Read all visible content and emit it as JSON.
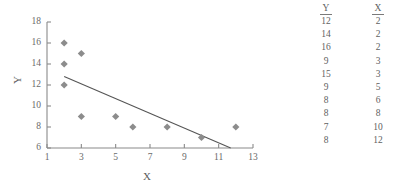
{
  "chart_data": {
    "type": "scatter",
    "title": "",
    "xlabel": "X",
    "ylabel": "Y",
    "xlim": [
      1,
      13
    ],
    "ylim": [
      6,
      18
    ],
    "xticks": [
      1,
      3,
      5,
      7,
      9,
      11,
      13
    ],
    "yticks": [
      6,
      8,
      10,
      12,
      14,
      16,
      18
    ],
    "grid": false,
    "legend": "none",
    "marker": "diamond",
    "marker_color": "#8c8c8c",
    "axis_color": "#8a8a8a",
    "line_color": "#555555",
    "points": [
      {
        "x": 2,
        "y": 12
      },
      {
        "x": 2,
        "y": 14
      },
      {
        "x": 2,
        "y": 16
      },
      {
        "x": 3,
        "y": 9
      },
      {
        "x": 3,
        "y": 15
      },
      {
        "x": 5,
        "y": 9
      },
      {
        "x": 6,
        "y": 8
      },
      {
        "x": 8,
        "y": 8
      },
      {
        "x": 10,
        "y": 7
      },
      {
        "x": 12,
        "y": 8
      }
    ],
    "trendline": {
      "x0": 2,
      "y0": 12.8,
      "x1": 11.7,
      "y1": 6.0
    }
  },
  "axes": {
    "x_title": "X",
    "y_title": "Y",
    "x_tick_labels": [
      "1",
      "3",
      "5",
      "7",
      "9",
      "11",
      "13"
    ],
    "y_tick_labels": [
      "6",
      "8",
      "10",
      "12",
      "14",
      "16",
      "18"
    ]
  },
  "table": {
    "headers": [
      "Y",
      "X"
    ],
    "rows": [
      [
        "12",
        "2"
      ],
      [
        "14",
        "2"
      ],
      [
        "16",
        "2"
      ],
      [
        "9",
        "3"
      ],
      [
        "15",
        "3"
      ],
      [
        "9",
        "5"
      ],
      [
        "8",
        "6"
      ],
      [
        "8",
        "8"
      ],
      [
        "7",
        "10"
      ],
      [
        "8",
        "12"
      ]
    ]
  }
}
